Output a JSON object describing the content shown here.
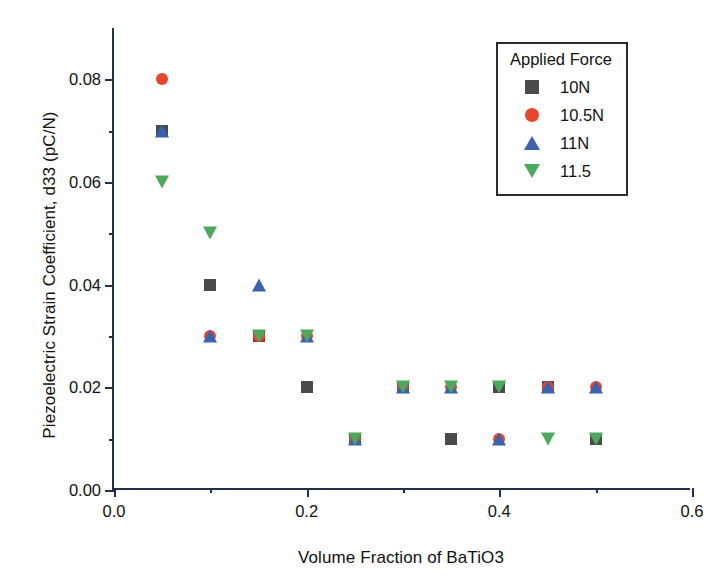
{
  "chart_data": {
    "type": "scatter",
    "title": "",
    "xlabel": "Volume Fraction of BaTiO3",
    "ylabel": "Piezoelectric Strain Coefficient, d33 (pC/N)",
    "xlim": [
      0.0,
      0.6
    ],
    "ylim": [
      0.0,
      0.09
    ],
    "grid": false,
    "legend_position": "top-right",
    "legend_title": "Applied Force",
    "xticks": [
      "0.0",
      "0.2",
      "0.4",
      "0.6"
    ],
    "xtick_values": [
      0.0,
      0.2,
      0.4,
      0.6
    ],
    "xminor_values": [
      0.1,
      0.3,
      0.5
    ],
    "yticks": [
      "0.00",
      "0.02",
      "0.04",
      "0.06",
      "0.08"
    ],
    "ytick_values": [
      0.0,
      0.02,
      0.04,
      0.06,
      0.08
    ],
    "yminor_values": [
      0.01,
      0.03,
      0.05,
      0.07
    ],
    "x": [
      0.05,
      0.1,
      0.15,
      0.2,
      0.25,
      0.3,
      0.35,
      0.4,
      0.45,
      0.5
    ],
    "series": [
      {
        "name": "10N",
        "marker": "square",
        "color": "#4a4a4a",
        "values": [
          0.07,
          0.04,
          0.03,
          0.02,
          0.01,
          0.02,
          0.01,
          0.02,
          0.02,
          0.01
        ]
      },
      {
        "name": "10.5N",
        "marker": "circle",
        "color": "#e8452c",
        "values": [
          0.08,
          0.03,
          0.03,
          0.03,
          0.01,
          0.02,
          0.02,
          0.01,
          0.02,
          0.02
        ]
      },
      {
        "name": "11N",
        "marker": "triangle-up",
        "color": "#3b62b0",
        "values": [
          0.07,
          0.03,
          0.04,
          0.03,
          0.01,
          0.02,
          0.02,
          0.01,
          0.02,
          0.02
        ]
      },
      {
        "name": "11.5",
        "marker": "triangle-down",
        "color": "#4ca85a",
        "values": [
          0.06,
          0.05,
          0.03,
          0.03,
          0.01,
          0.02,
          0.02,
          0.02,
          0.01,
          0.01
        ]
      }
    ]
  },
  "legend": {
    "title": "Applied Force",
    "entries": [
      {
        "label": "10N",
        "marker": "square",
        "color": "#4a4a4a"
      },
      {
        "label": "10.5N",
        "marker": "circle",
        "color": "#e8452c"
      },
      {
        "label": "11N",
        "marker": "triangle-up",
        "color": "#3b62b0"
      },
      {
        "label": "11.5",
        "marker": "triangle-down",
        "color": "#4ca85a"
      }
    ]
  },
  "axes": {
    "x_title": "Volume Fraction of BaTiO3",
    "y_title": "Piezoelectric Strain Coefficient, d33 (pC/N)"
  },
  "style": {
    "axis_color": "#23304a",
    "text_color": "#111111",
    "background": "#ffffff"
  }
}
